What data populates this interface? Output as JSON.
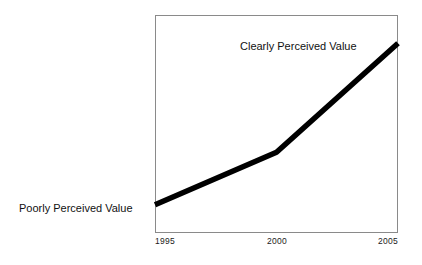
{
  "chart_data": {
    "type": "line",
    "title": "",
    "subtitle": "",
    "xlabel": "",
    "ylabel": "",
    "x": [
      1995,
      2000,
      2005
    ],
    "xticklabels": [
      "1995",
      "2000",
      "2005"
    ],
    "xlim": [
      1995,
      2005
    ],
    "ylim": [
      0,
      100
    ],
    "yticklabels": [],
    "grid": false,
    "legend": null,
    "series": [
      {
        "name": "Perceived Value",
        "values": [
          13,
          37,
          87
        ],
        "color": "#000000",
        "linewidth": 5.5
      }
    ],
    "annotations": [
      {
        "text": "Poorly Perceived Value",
        "position": "left-of-axis-start",
        "x": 1995,
        "y": 13
      },
      {
        "text": "Clearly Perceived Value",
        "position": "above-line-end",
        "x": 2004,
        "y": 90
      }
    ],
    "axis_frame_color": "#8a8a8a",
    "background_color": "#ffffff"
  },
  "figure": {
    "tick_labels": {
      "start": "1995",
      "middle": "2000",
      "end": "2005"
    },
    "annotations": {
      "low": "Poorly Perceived Value",
      "high": "Clearly Perceived Value"
    }
  }
}
